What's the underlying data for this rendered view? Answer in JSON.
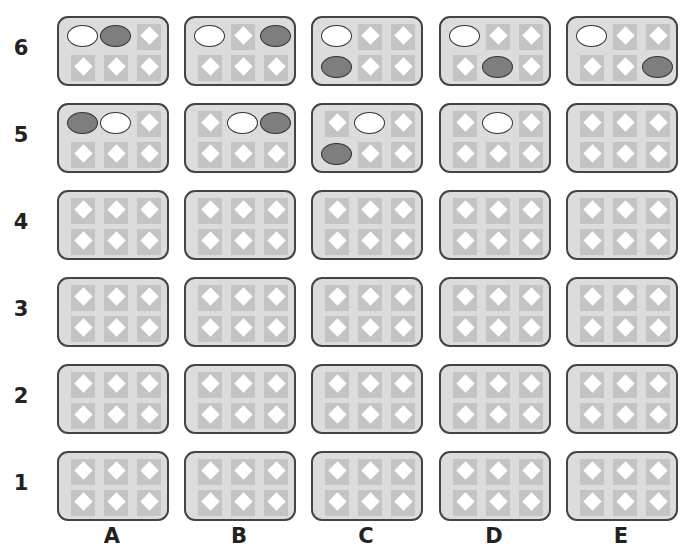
{
  "columns": [
    "A",
    "B",
    "C",
    "D",
    "E"
  ],
  "rows": [
    "6",
    "5",
    "4",
    "3",
    "2",
    "1"
  ],
  "colors": {
    "card_bg": "#dcdcdc",
    "card_border": "#444444",
    "square": "#c4c4c4",
    "diamond": "#ffffff",
    "counter_white": "#ffffff",
    "counter_gray": "#7e7e7e"
  },
  "legend_note": "Each card is a 3x2 grid of cells; cells are indexed 0-5 (top row 0-2, bottom row 3-5). Values: 'empty' (diamond), 'white' (white oval), 'gray' (gray oval).",
  "grid": {
    "6": {
      "A": [
        "white",
        "gray",
        "empty",
        "empty",
        "empty",
        "empty"
      ],
      "B": [
        "white",
        "empty",
        "gray",
        "empty",
        "empty",
        "empty"
      ],
      "C": [
        "white",
        "empty",
        "empty",
        "gray",
        "empty",
        "empty"
      ],
      "D": [
        "white",
        "empty",
        "empty",
        "empty",
        "gray",
        "empty"
      ],
      "E": [
        "white",
        "empty",
        "empty",
        "empty",
        "empty",
        "gray"
      ]
    },
    "5": {
      "A": [
        "gray",
        "white",
        "empty",
        "empty",
        "empty",
        "empty"
      ],
      "B": [
        "empty",
        "white",
        "gray",
        "empty",
        "empty",
        "empty"
      ],
      "C": [
        "empty",
        "white",
        "empty",
        "gray",
        "empty",
        "empty"
      ],
      "D": [
        "empty",
        "white",
        "empty",
        "empty",
        "empty",
        "empty"
      ],
      "E": [
        "empty",
        "empty",
        "empty",
        "empty",
        "empty",
        "empty"
      ]
    },
    "4": {
      "A": [
        "empty",
        "empty",
        "empty",
        "empty",
        "empty",
        "empty"
      ],
      "B": [
        "empty",
        "empty",
        "empty",
        "empty",
        "empty",
        "empty"
      ],
      "C": [
        "empty",
        "empty",
        "empty",
        "empty",
        "empty",
        "empty"
      ],
      "D": [
        "empty",
        "empty",
        "empty",
        "empty",
        "empty",
        "empty"
      ],
      "E": [
        "empty",
        "empty",
        "empty",
        "empty",
        "empty",
        "empty"
      ]
    },
    "3": {
      "A": [
        "empty",
        "empty",
        "empty",
        "empty",
        "empty",
        "empty"
      ],
      "B": [
        "empty",
        "empty",
        "empty",
        "empty",
        "empty",
        "empty"
      ],
      "C": [
        "empty",
        "empty",
        "empty",
        "empty",
        "empty",
        "empty"
      ],
      "D": [
        "empty",
        "empty",
        "empty",
        "empty",
        "empty",
        "empty"
      ],
      "E": [
        "empty",
        "empty",
        "empty",
        "empty",
        "empty",
        "empty"
      ]
    },
    "2": {
      "A": [
        "empty",
        "empty",
        "empty",
        "empty",
        "empty",
        "empty"
      ],
      "B": [
        "empty",
        "empty",
        "empty",
        "empty",
        "empty",
        "empty"
      ],
      "C": [
        "empty",
        "empty",
        "empty",
        "empty",
        "empty",
        "empty"
      ],
      "D": [
        "empty",
        "empty",
        "empty",
        "empty",
        "empty",
        "empty"
      ],
      "E": [
        "empty",
        "empty",
        "empty",
        "empty",
        "empty",
        "empty"
      ]
    },
    "1": {
      "A": [
        "empty",
        "empty",
        "empty",
        "empty",
        "empty",
        "empty"
      ],
      "B": [
        "empty",
        "empty",
        "empty",
        "empty",
        "empty",
        "empty"
      ],
      "C": [
        "empty",
        "empty",
        "empty",
        "empty",
        "empty",
        "empty"
      ],
      "D": [
        "empty",
        "empty",
        "empty",
        "empty",
        "empty",
        "empty"
      ],
      "E": [
        "empty",
        "empty",
        "empty",
        "empty",
        "empty",
        "empty"
      ]
    }
  }
}
